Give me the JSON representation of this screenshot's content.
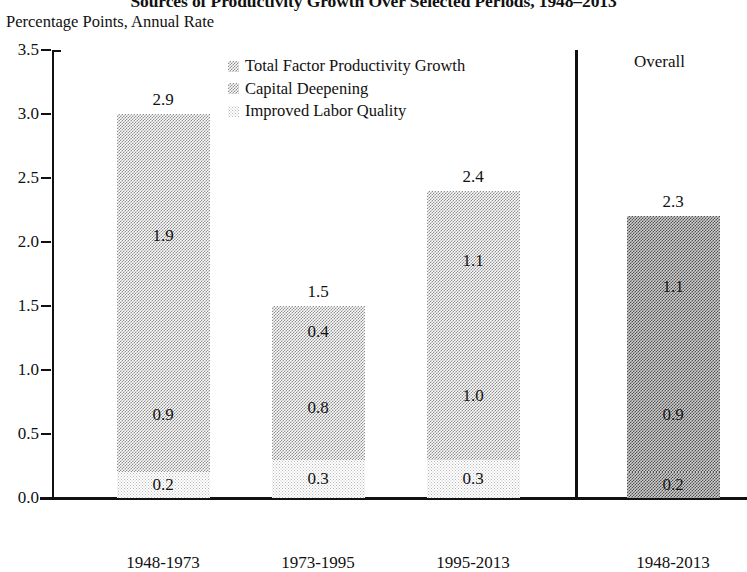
{
  "chart_data": {
    "type": "bar",
    "subtype": "stacked-bar",
    "title": "Sources of Productivity Growth Over Selected Periods, 1948–2013",
    "subtitle": "Percentage Points, Annual Rate",
    "xlabel": "",
    "ylabel": "Percentage Points, Annual Rate",
    "ylim": [
      0.0,
      3.5
    ],
    "ytick_labels": [
      "0.0",
      "0.5",
      "1.0",
      "1.5",
      "2.0",
      "2.5",
      "3.0",
      "3.5"
    ],
    "ytick_values": [
      0.0,
      0.5,
      1.0,
      1.5,
      2.0,
      2.5,
      3.0,
      3.5
    ],
    "grid": false,
    "legend_position": "top-center",
    "categories": [
      "1948-1973",
      "1973-1995",
      "1995-2013",
      "1948-2013"
    ],
    "series": [
      {
        "name": "Improved Labor Quality",
        "values": [
          0.2,
          0.3,
          0.3,
          0.2
        ]
      },
      {
        "name": "Capital Deepening",
        "values": [
          0.9,
          0.8,
          1.0,
          0.9
        ]
      },
      {
        "name": "Total Factor Productivity Growth",
        "values": [
          1.9,
          0.4,
          1.1,
          1.1
        ]
      }
    ],
    "totals": [
      2.9,
      1.5,
      2.4,
      2.3
    ],
    "annotations": {
      "overall_panel_label": "Overall",
      "overall_panel_categories": [
        "1948-2013"
      ]
    },
    "colors": {
      "total_factor_productivity_growth": "#a8a8a8",
      "capital_deepening": "#a8a8a8",
      "improved_labor_quality": "#dddddd",
      "overall_bar": "#8a8a8a",
      "axis": "#111111",
      "text": "#111111",
      "background": "#ffffff"
    }
  },
  "legend": {
    "items": [
      {
        "label": "Total Factor Productivity Growth",
        "swatch": "tfp"
      },
      {
        "label": "Capital Deepening",
        "swatch": "capital"
      },
      {
        "label": "Improved Labor Quality",
        "swatch": "labor"
      }
    ]
  },
  "axis": {
    "y_labels": [
      "3.5",
      "3.0",
      "2.5",
      "2.0",
      "1.5",
      "1.0",
      "0.5",
      "0.0"
    ]
  },
  "bars": [
    {
      "category": "1948-1973",
      "total_label": "2.9",
      "segments": [
        {
          "key": "tfp",
          "label": "1.9",
          "value": 1.9
        },
        {
          "key": "capital",
          "label": "0.9",
          "value": 0.9
        },
        {
          "key": "labor",
          "label": "0.2",
          "value": 0.2
        }
      ]
    },
    {
      "category": "1973-1995",
      "total_label": "1.5",
      "segments": [
        {
          "key": "tfp",
          "label": "0.4",
          "value": 0.4
        },
        {
          "key": "capital",
          "label": "0.8",
          "value": 0.8
        },
        {
          "key": "labor",
          "label": "0.3",
          "value": 0.3
        }
      ]
    },
    {
      "category": "1995-2013",
      "total_label": "2.4",
      "segments": [
        {
          "key": "tfp",
          "label": "1.1",
          "value": 1.1
        },
        {
          "key": "capital",
          "label": "1.0",
          "value": 1.0
        },
        {
          "key": "labor",
          "label": "0.3",
          "value": 0.3
        }
      ]
    },
    {
      "category": "1948-2013",
      "total_label": "2.3",
      "overall": true,
      "segments": [
        {
          "key": "overall",
          "label": "1.1",
          "value": 1.1
        },
        {
          "key": "overall",
          "label": "0.9",
          "value": 0.9
        },
        {
          "key": "overall",
          "label": "0.2",
          "value": 0.2
        }
      ]
    }
  ],
  "overall_panel": {
    "header": "Overall"
  }
}
